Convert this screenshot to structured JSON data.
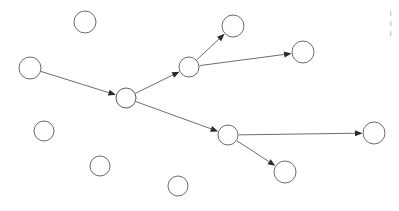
{
  "canvas": {
    "width": 399,
    "height": 211,
    "background": "#ffffff",
    "title": "node-link graph"
  },
  "style": {
    "node_fill": "#ffffff",
    "node_stroke": "#6b6b6b",
    "node_stroke_width": 1,
    "edge_stroke": "#6e6e6e",
    "edge_stroke_width": 1,
    "arrowhead_fill": "#2a2a2a",
    "text_color": "#3a3a3a"
  },
  "graph": {
    "nodes": [
      {
        "id": "n1",
        "name": "source-node-left",
        "cx": 30,
        "cy": 68,
        "r": 11,
        "role": "source",
        "label": ""
      },
      {
        "id": "n2",
        "name": "hub-node-center",
        "cx": 126,
        "cy": 98,
        "r": 10,
        "role": "hub",
        "label": ""
      },
      {
        "id": "n3",
        "name": "branch-node-upper",
        "cx": 189,
        "cy": 67,
        "r": 10,
        "role": "branch",
        "label": ""
      },
      {
        "id": "n4",
        "name": "leaf-node-top",
        "cx": 233,
        "cy": 26,
        "r": 11,
        "role": "leaf",
        "label": ""
      },
      {
        "id": "n5",
        "name": "leaf-node-upper-right",
        "cx": 303,
        "cy": 52,
        "r": 11,
        "role": "leaf",
        "label": ""
      },
      {
        "id": "n6",
        "name": "branch-node-lower",
        "cx": 228,
        "cy": 135,
        "r": 10,
        "role": "branch",
        "label": ""
      },
      {
        "id": "n7",
        "name": "leaf-node-far-right",
        "cx": 374,
        "cy": 133,
        "r": 11,
        "role": "leaf",
        "label": ""
      },
      {
        "id": "n8",
        "name": "leaf-node-bottom-right",
        "cx": 285,
        "cy": 172,
        "r": 11,
        "role": "leaf",
        "label": ""
      },
      {
        "id": "n9",
        "name": "isolated-node-top-left",
        "cx": 85,
        "cy": 22,
        "r": 11,
        "role": "isolated",
        "label": ""
      },
      {
        "id": "n10",
        "name": "isolated-node-left",
        "cx": 44,
        "cy": 131,
        "r": 10,
        "role": "isolated",
        "label": ""
      },
      {
        "id": "n11",
        "name": "isolated-node-bottom-a",
        "cx": 100,
        "cy": 166,
        "r": 10,
        "role": "isolated",
        "label": ""
      },
      {
        "id": "n12",
        "name": "isolated-node-bottom-b",
        "cx": 178,
        "cy": 186,
        "r": 10,
        "role": "isolated",
        "label": ""
      }
    ],
    "edges": [
      {
        "id": "e1",
        "name": "edge-source-to-hub",
        "from": "n1",
        "to": "n2",
        "directed": true
      },
      {
        "id": "e2",
        "name": "edge-hub-to-branch-upper",
        "from": "n2",
        "to": "n3",
        "directed": true
      },
      {
        "id": "e3",
        "name": "edge-branch-upper-to-top",
        "from": "n3",
        "to": "n4",
        "directed": true
      },
      {
        "id": "e4",
        "name": "edge-branch-upper-to-right",
        "from": "n3",
        "to": "n5",
        "directed": true
      },
      {
        "id": "e5",
        "name": "edge-hub-to-branch-lower",
        "from": "n2",
        "to": "n6",
        "directed": true
      },
      {
        "id": "e6",
        "name": "edge-branch-lower-to-far",
        "from": "n6",
        "to": "n7",
        "directed": true
      },
      {
        "id": "e7",
        "name": "edge-branch-lower-to-bottom",
        "from": "n6",
        "to": "n8",
        "directed": true
      }
    ],
    "node_count": 12,
    "edge_count": 7
  },
  "clipped_text": {
    "name": "clipped-caption-right-edge",
    "lines": [
      "|",
      "|",
      "|"
    ]
  }
}
